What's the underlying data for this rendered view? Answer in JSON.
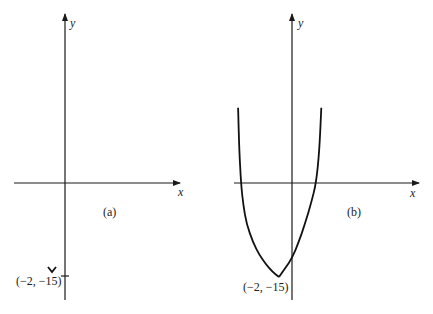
{
  "chart_data": [
    {
      "type": "line",
      "panel_label": "(a)",
      "xlabel": "x",
      "ylabel": "y",
      "points_marked": [
        {
          "x": -2,
          "y": -15,
          "label": "(−2, −15)",
          "marker": "v-shape"
        }
      ],
      "y_ticks": [
        -15
      ],
      "series": [],
      "xlim": [
        -8,
        18
      ],
      "ylim": [
        -19,
        27
      ]
    },
    {
      "type": "line",
      "panel_label": "(b)",
      "xlabel": "x",
      "ylabel": "y",
      "points_marked": [
        {
          "x": -2,
          "y": -15,
          "label": "(−2, −15)"
        }
      ],
      "series": [
        {
          "name": "curve",
          "x": [
            -8.3,
            -8.1,
            -7.85,
            -7.5,
            -7,
            -6,
            -5,
            -4,
            -3,
            -2,
            -1,
            0,
            1,
            2,
            3,
            3.7,
            4.2,
            4.5
          ],
          "y": [
            12,
            5,
            0,
            -3.5,
            -6.5,
            -9.5,
            -11.5,
            -13,
            -14.2,
            -15,
            -13.5,
            -12,
            -9.5,
            -6.5,
            -3,
            0,
            5,
            12
          ]
        }
      ],
      "xlim": [
        -9,
        19
      ],
      "ylim": [
        -19,
        27
      ]
    }
  ]
}
